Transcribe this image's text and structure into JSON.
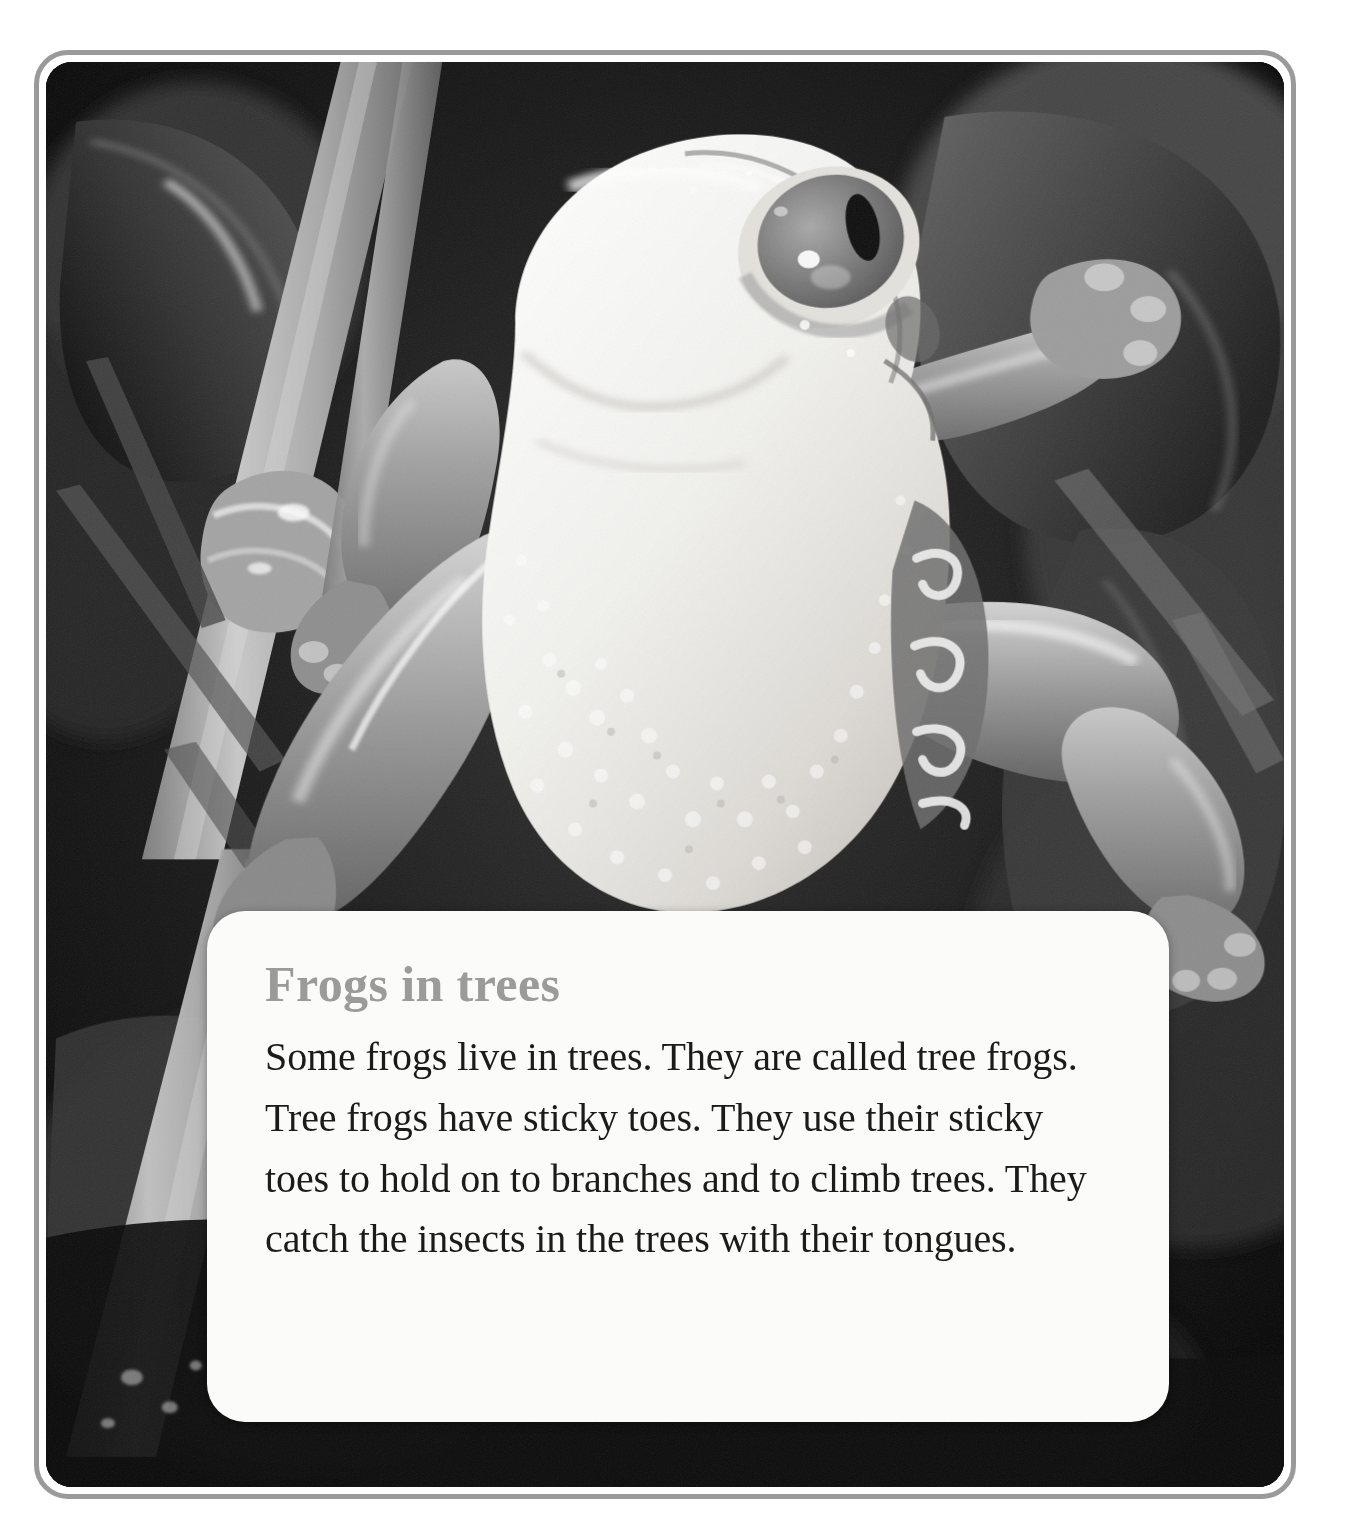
{
  "page": {
    "type": "picture-book-page",
    "background_color": "#ffffff"
  },
  "frame": {
    "border_color": "#9a9a9a",
    "inner_gap_color": "#ffffff",
    "corner_radius_px": 34
  },
  "photograph": {
    "alt_name": "tree-frog-photo",
    "description": "Black and white photograph of a tree frog with large eye and sticky toes clinging to plant stems among leaves",
    "palette": {
      "background_dark": "#0a0a0a",
      "leaf_dark": "#2f2f2f",
      "leaf_mid": "#4a4a4a",
      "stem_light": "#b9b9b9",
      "belly_white": "#f4f4f2",
      "limb_gray": "#9c9c9c",
      "eye_ring": "#dcdcdc",
      "eye_iris": "#7d7d7d",
      "eye_pupil": "#121212",
      "highlight": "#ffffff"
    }
  },
  "text_card": {
    "background_color": "#fbfbfa",
    "corner_radius_px": 38,
    "title": "Frogs in trees",
    "title_color": "#9b9b9b",
    "body_color": "#1b1b1b",
    "body": "Some frogs live in trees. They are called tree frogs. Tree frogs have sticky toes. They use their sticky toes to hold on to branches and to climb trees. They catch the insects in the trees with their tongues.",
    "body_lines": [
      "Some frogs live in trees. They are called tree",
      "frogs. Tree frogs have sticky toes. They use",
      "their sticky toes to hold on to branches and",
      "to climb trees. They catch the insects in the",
      "trees with their tongues."
    ]
  }
}
